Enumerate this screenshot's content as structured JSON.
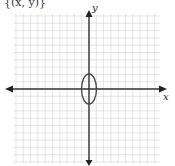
{
  "header_fragment": "{(x, y)}",
  "graph": {
    "x_axis_label": "x",
    "y_axis_label": "y",
    "grid_color": "#d4d4d4",
    "axis_color": "#333333",
    "curve_color": "#444444",
    "grid": {
      "left": 14,
      "top": 14,
      "right": 160,
      "bottom": 163,
      "spacing": 7.3
    },
    "origin_px": [
      89,
      89
    ]
  },
  "chart_data": {
    "type": "scatter",
    "title": "",
    "xlabel": "x",
    "ylabel": "y",
    "xlim": [
      -10,
      10
    ],
    "ylim": [
      -10,
      10
    ],
    "grid": true,
    "curves": [
      {
        "name": "ellipse",
        "equation": "x^2/1 + y^2/4 = 1",
        "center": [
          0,
          0
        ],
        "semi_axis_x": 1,
        "semi_axis_y": 2
      }
    ]
  }
}
